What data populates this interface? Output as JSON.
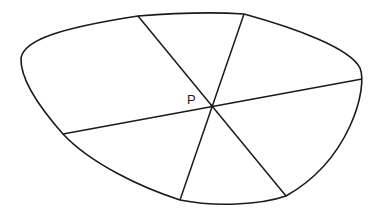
{
  "diagram": {
    "type": "closed convex region with three chords through a point",
    "stroke_color": "#1a1a1a",
    "background": "#ffffff",
    "point": {
      "label": "P",
      "x": 212,
      "y": 106
    },
    "boundary": "M138,16 C175,13 215,12 244,14 C295,28 350,48 360,68 C368,88 350,160 286,196 C260,205 215,207 180,200 C140,187 90,163 63,134 C40,108 20,80 21,58 C24,40 60,28 138,16 Z",
    "chords": [
      {
        "name": "chord-1",
        "x1": 138,
        "y1": 16,
        "x2": 286,
        "y2": 196
      },
      {
        "name": "chord-2",
        "x1": 244,
        "y1": 14,
        "x2": 180,
        "y2": 200
      },
      {
        "name": "chord-3",
        "x1": 63,
        "y1": 134,
        "x2": 362,
        "y2": 79
      }
    ]
  }
}
